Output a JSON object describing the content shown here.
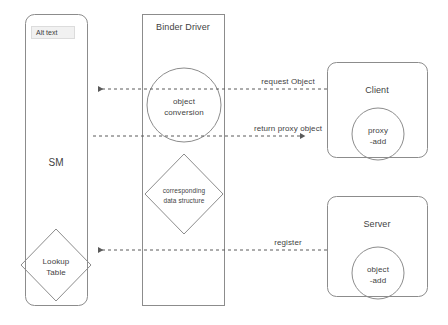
{
  "diagram": {
    "title_note": "Android Binder object conversion diagram",
    "alt_text_badge": "Alt text",
    "nodes": {
      "sm": {
        "label": "SM",
        "shape": "rounded-rect"
      },
      "binder_driver": {
        "label": "Binder Driver",
        "shape": "rect"
      },
      "client": {
        "label": "Client",
        "shape": "rounded-rect"
      },
      "server": {
        "label": "Server",
        "shape": "rounded-rect"
      },
      "object_conversion": {
        "line1": "object",
        "line2": "conversion",
        "shape": "circle"
      },
      "corresponding_data_structure": {
        "line1": "corresponding",
        "line2": "data structure",
        "shape": "diamond"
      },
      "lookup_table": {
        "line1": "Lookup",
        "line2": "Table",
        "shape": "diamond"
      },
      "proxy_add": {
        "line1": "proxy",
        "line2": "-add",
        "shape": "circle"
      },
      "object_add": {
        "line1": "object",
        "line2": "-add",
        "shape": "circle"
      }
    },
    "edges": [
      {
        "id": "request-object",
        "label": "request Object",
        "direction": "right-to-left",
        "style": "dashed"
      },
      {
        "id": "return-proxy-object",
        "label": "return proxy object",
        "direction": "left-to-right",
        "style": "dashed"
      },
      {
        "id": "register",
        "label": "register",
        "direction": "right-to-left",
        "style": "dashed"
      }
    ],
    "colors": {
      "stroke": "#808080",
      "text": "#3f3f3f",
      "background": "#ffffff",
      "badge_bg": "#f1f1f1",
      "badge_border": "#dcdcdc"
    }
  }
}
